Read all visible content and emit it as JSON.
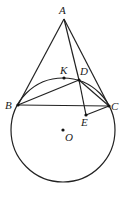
{
  "diagram": {
    "type": "geometry",
    "circle": {
      "center": "O",
      "cx": 63,
      "cy": 130,
      "r": 52
    },
    "points": [
      {
        "name": "A",
        "x": 64,
        "y": 19,
        "lx": 59,
        "ly": 14
      },
      {
        "name": "K",
        "x": 64,
        "y": 78,
        "lx": 60,
        "ly": 74
      },
      {
        "name": "D",
        "x": 79,
        "y": 80,
        "lx": 80,
        "ly": 75
      },
      {
        "name": "B",
        "x": 18,
        "y": 105,
        "lx": 5,
        "ly": 109
      },
      {
        "name": "C",
        "x": 109,
        "y": 106,
        "lx": 111,
        "ly": 110
      },
      {
        "name": "E",
        "x": 86,
        "y": 115,
        "lx": 81,
        "ly": 126
      },
      {
        "name": "O",
        "x": 63,
        "y": 130,
        "lx": 65,
        "ly": 141
      }
    ],
    "segments": [
      "AB",
      "AC",
      "AD",
      "BC",
      "BD",
      "DC",
      "DE",
      "EC"
    ],
    "dots": [
      "K",
      "D",
      "B",
      "C",
      "E",
      "O"
    ]
  }
}
